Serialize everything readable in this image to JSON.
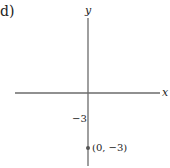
{
  "part_label": "d)",
  "axes": {
    "x_label": "x",
    "y_label": "y"
  },
  "ticks": {
    "y_tick_label": "−3"
  },
  "point": {
    "label": "(0, −3)",
    "x": 0,
    "y": -3
  },
  "colors": {
    "axis": "#6b6b6b",
    "point": "#555555",
    "text": "#222222"
  }
}
